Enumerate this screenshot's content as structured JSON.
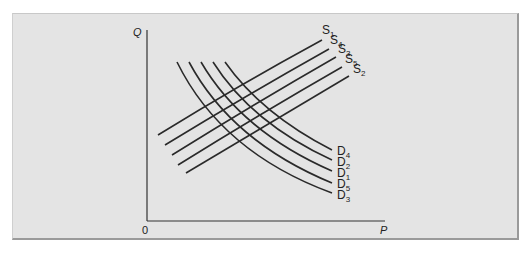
{
  "chart_data": {
    "type": "line",
    "title": "",
    "xlabel": "P",
    "ylabel": "Q",
    "origin_label": "0",
    "grid": false,
    "legend": "inline curve labels",
    "supply_curves": [
      {
        "name": "S1",
        "label": "S",
        "sub": "1",
        "points": [
          [
            158,
            135
          ],
          [
            240,
            86
          ],
          [
            322,
            40
          ]
        ]
      },
      {
        "name": "S4",
        "label": "S",
        "sub": "4",
        "points": [
          [
            165,
            145
          ],
          [
            247,
            96
          ],
          [
            329,
            49
          ]
        ]
      },
      {
        "name": "S3",
        "label": "S",
        "sub": "3",
        "points": [
          [
            172,
            155
          ],
          [
            254,
            105
          ],
          [
            336,
            57
          ]
        ]
      },
      {
        "name": "S5",
        "label": "S",
        "sub": "5",
        "points": [
          [
            178,
            165
          ],
          [
            260,
            115
          ],
          [
            342,
            67
          ]
        ]
      },
      {
        "name": "S2",
        "label": "S",
        "sub": "2",
        "points": [
          [
            186,
            173
          ],
          [
            268,
            124
          ],
          [
            349,
            76
          ]
        ]
      }
    ],
    "demand_curves": [
      {
        "name": "D4",
        "label": "D",
        "sub": "4",
        "points": [
          [
            225,
            62
          ],
          [
            270,
            110
          ],
          [
            332,
            150
          ]
        ]
      },
      {
        "name": "D2",
        "label": "D",
        "sub": "2",
        "points": [
          [
            213,
            62
          ],
          [
            262,
            117
          ],
          [
            332,
            160
          ]
        ]
      },
      {
        "name": "D1",
        "label": "D",
        "sub": "1",
        "points": [
          [
            201,
            62
          ],
          [
            254,
            124
          ],
          [
            332,
            171
          ]
        ]
      },
      {
        "name": "D5",
        "label": "D",
        "sub": "5",
        "points": [
          [
            189,
            62
          ],
          [
            246,
            132
          ],
          [
            332,
            183
          ]
        ]
      },
      {
        "name": "D3",
        "label": "D",
        "sub": "3",
        "points": [
          [
            177,
            62
          ],
          [
            238,
            140
          ],
          [
            332,
            193
          ]
        ]
      }
    ],
    "supply_labels_pos": [
      [
        322,
        34
      ],
      [
        330,
        44
      ],
      [
        338,
        53
      ],
      [
        345,
        63
      ],
      [
        353,
        73
      ]
    ],
    "demand_labels_pos": [
      [
        337,
        155
      ],
      [
        337,
        166
      ],
      [
        337,
        177
      ],
      [
        337,
        188
      ],
      [
        337,
        199
      ]
    ]
  },
  "axes": {
    "y_label": "Q",
    "x_label": "P",
    "origin": "0"
  }
}
